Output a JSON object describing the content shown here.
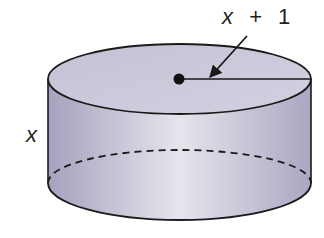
{
  "figure": {
    "type": "cylinder",
    "radius_label": {
      "var": "x",
      "op": "+",
      "num": "1"
    },
    "height_label": "x",
    "colors": {
      "stroke": "#1a1a1a",
      "side_dark": "#a9a7c2",
      "side_light": "#e3e2ea",
      "top_fill": "#c9c8d9",
      "background": "#ffffff"
    }
  }
}
